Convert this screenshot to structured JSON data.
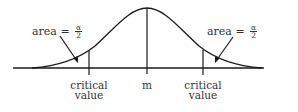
{
  "diagram": {
    "title": "",
    "curve": "normal distribution (bell curve)",
    "labels": {
      "mean": "m",
      "left_critical_line1": "critical",
      "left_critical_line2": "value",
      "right_critical_line1": "critical",
      "right_critical_line2": "value",
      "left_area_prefix": "area =",
      "left_area_num": "α",
      "left_area_den": "2",
      "right_area_prefix": "area =",
      "right_area_num": "α",
      "right_area_den": "2"
    },
    "colors": {
      "line": "#1a1a1a",
      "text": "#333333",
      "background": "#ffffff"
    }
  }
}
